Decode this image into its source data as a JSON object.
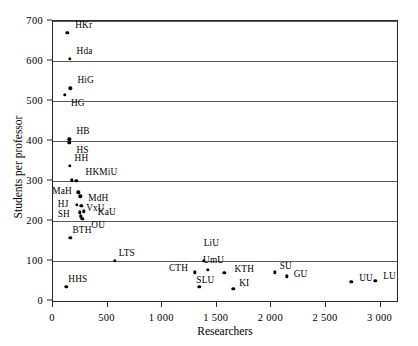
{
  "chart_data": {
    "type": "scatter",
    "title": "",
    "xlabel": "Researchers",
    "ylabel": "Students per professor",
    "xlim": [
      0,
      3150
    ],
    "ylim": [
      0,
      700
    ],
    "xticks": [
      0,
      500,
      1000,
      1500,
      2000,
      2500,
      3000
    ],
    "xtick_labels": [
      "0",
      "500",
      "1 000",
      "1 500",
      "2 000",
      "2 500",
      "3 000"
    ],
    "yticks": [
      0,
      100,
      200,
      300,
      400,
      500,
      600,
      700
    ],
    "ytick_labels": [
      "0",
      "100",
      "200",
      "300",
      "400",
      "500",
      "600",
      "700"
    ],
    "grid": "horizontal",
    "legend": "none",
    "points": [
      {
        "label": "HKr",
        "x": 130,
        "y": 670,
        "lx": 8,
        "ly": -13
      },
      {
        "label": "Hda",
        "x": 152,
        "y": 606,
        "lx": 7,
        "ly": -13
      },
      {
        "label": "HiG",
        "x": 160,
        "y": 532,
        "lx": 7,
        "ly": -13
      },
      {
        "label": "HG",
        "x": 110,
        "y": 515,
        "lx": 6,
        "ly": 3
      },
      {
        "label": "HB",
        "x": 150,
        "y": 404,
        "lx": 7,
        "ly": -13
      },
      {
        "label": "HS",
        "x": 150,
        "y": 396,
        "lx": 7,
        "ly": 2
      },
      {
        "label": "HH",
        "x": 152,
        "y": 338,
        "lx": 5,
        "ly": -13
      },
      {
        "label": "HKMiU",
        "x": 170,
        "y": 302,
        "lx": 14,
        "ly": -13
      },
      {
        "label": "",
        "x": 212,
        "y": 301,
        "lx": 0,
        "ly": 0
      },
      {
        "label": "MaH",
        "x": 232,
        "y": 272,
        "lx": -26,
        "ly": -6
      },
      {
        "label": "MdH",
        "x": 250,
        "y": 262,
        "lx": 8,
        "ly": -3
      },
      {
        "label": "HJ",
        "x": 218,
        "y": 240,
        "lx": -19,
        "ly": -6
      },
      {
        "label": "VxU",
        "x": 258,
        "y": 238,
        "lx": 5,
        "ly": -3
      },
      {
        "label": "SH",
        "x": 244,
        "y": 222,
        "lx": -22,
        "ly": -3
      },
      {
        "label": "KaU",
        "x": 282,
        "y": 224,
        "lx": 14,
        "ly": -4
      },
      {
        "label": "OU",
        "x": 268,
        "y": 205,
        "lx": 9,
        "ly": 1
      },
      {
        "label": "",
        "x": 252,
        "y": 212,
        "lx": 0,
        "ly": 0
      },
      {
        "label": "BTH",
        "x": 160,
        "y": 158,
        "lx": 2,
        "ly": -13
      },
      {
        "label": "LTS",
        "x": 565,
        "y": 100,
        "lx": 4,
        "ly": -13
      },
      {
        "label": "HHS",
        "x": 122,
        "y": 36,
        "lx": 2,
        "ly": -13
      },
      {
        "label": "LiU",
        "x": 1380,
        "y": 100,
        "lx": 0,
        "ly": -23
      },
      {
        "label": "CTH",
        "x": 1300,
        "y": 72,
        "lx": -26,
        "ly": -9
      },
      {
        "label": "UmU",
        "x": 1420,
        "y": 78,
        "lx": -5,
        "ly": -15
      },
      {
        "label": "KTH",
        "x": 1570,
        "y": 70,
        "lx": 10,
        "ly": -9
      },
      {
        "label": "SLU",
        "x": 1340,
        "y": 36,
        "lx": -3,
        "ly": -12
      },
      {
        "label": "KI",
        "x": 1650,
        "y": 30,
        "lx": 6,
        "ly": -11
      },
      {
        "label": "SU",
        "x": 2030,
        "y": 72,
        "lx": 5,
        "ly": -11
      },
      {
        "label": "GU",
        "x": 2140,
        "y": 62,
        "lx": 7,
        "ly": -7
      },
      {
        "label": "UU",
        "x": 2730,
        "y": 48,
        "lx": 8,
        "ly": -9
      },
      {
        "label": "LU",
        "x": 2950,
        "y": 50,
        "lx": 8,
        "ly": -10
      }
    ]
  },
  "colors": {
    "point": "#000000",
    "grid": "#5a5a5a",
    "frame": "#2b2b2b",
    "background": "#ffffff"
  }
}
